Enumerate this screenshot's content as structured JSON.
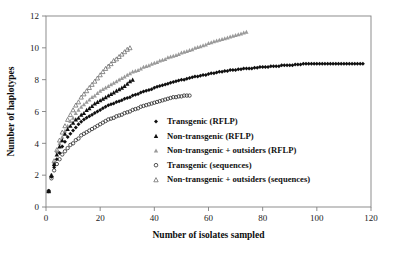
{
  "chart_data": {
    "type": "scatter",
    "title": "",
    "xlabel": "Number of isolates sampled",
    "ylabel": "Number of haplotypes",
    "xlim": [
      0,
      120
    ],
    "ylim": [
      0,
      12
    ],
    "xticks": [
      0,
      20,
      40,
      60,
      80,
      100,
      120
    ],
    "yticks": [
      0,
      2,
      4,
      6,
      8,
      10,
      12
    ],
    "grid": false,
    "legend_position": "center",
    "series": [
      {
        "name": "Transgenic (RFLP)",
        "marker": "filled-diamond",
        "color": "#101010",
        "x": [
          1,
          2,
          3,
          4,
          5,
          6,
          7,
          8,
          9,
          10,
          11,
          12,
          13,
          14,
          15,
          16,
          17,
          18,
          19,
          20,
          21,
          22,
          23,
          24,
          25,
          26,
          27,
          28,
          29,
          30,
          31,
          32,
          33,
          34,
          35,
          36,
          37,
          38,
          39,
          40,
          41,
          42,
          43,
          44,
          45,
          46,
          47,
          48,
          49,
          50,
          51,
          52,
          53,
          54,
          55,
          56,
          57,
          58,
          59,
          60,
          61,
          62,
          63,
          64,
          65,
          66,
          67,
          68,
          69,
          70,
          71,
          72,
          73,
          74,
          75,
          76,
          77,
          78,
          79,
          80,
          81,
          82,
          83,
          84,
          85,
          86,
          87,
          88,
          89,
          90,
          91,
          92,
          93,
          94,
          95,
          96,
          97,
          98,
          99,
          100,
          101,
          102,
          103,
          104,
          105,
          106,
          107,
          108,
          109,
          110,
          111,
          112,
          113,
          114,
          115,
          116,
          117
        ],
        "y": [
          1.0,
          1.9,
          2.5,
          3.0,
          3.4,
          3.8,
          4.1,
          4.4,
          4.6,
          4.8,
          5.0,
          5.2,
          5.35,
          5.5,
          5.6,
          5.7,
          5.8,
          5.9,
          6.0,
          6.1,
          6.2,
          6.3,
          6.4,
          6.45,
          6.5,
          6.6,
          6.65,
          6.7,
          6.8,
          6.85,
          6.9,
          7.0,
          7.05,
          7.1,
          7.2,
          7.25,
          7.3,
          7.35,
          7.4,
          7.5,
          7.55,
          7.6,
          7.65,
          7.7,
          7.75,
          7.8,
          7.85,
          7.9,
          7.95,
          8.0,
          8.0,
          8.05,
          8.1,
          8.15,
          8.2,
          8.2,
          8.25,
          8.3,
          8.3,
          8.35,
          8.4,
          8.4,
          8.45,
          8.5,
          8.5,
          8.55,
          8.55,
          8.6,
          8.6,
          8.6,
          8.65,
          8.65,
          8.7,
          8.7,
          8.7,
          8.7,
          8.75,
          8.75,
          8.8,
          8.8,
          8.8,
          8.8,
          8.85,
          8.85,
          8.85,
          8.85,
          8.9,
          8.9,
          8.9,
          8.9,
          8.9,
          8.95,
          8.95,
          8.95,
          9.0,
          9.0,
          9.0,
          9.0,
          9.0,
          9.0,
          9.0,
          9.0,
          9.0,
          9.0,
          9.0,
          9.0,
          9.0,
          9.0,
          9.0,
          9.0,
          9.0,
          9.0,
          9.0,
          9.0,
          9.0,
          9.0,
          9.0
        ]
      },
      {
        "name": "Non-transgenic (RFLP)",
        "marker": "filled-triangle",
        "color": "#101010",
        "x": [
          1,
          2,
          3,
          4,
          5,
          6,
          7,
          8,
          9,
          10,
          11,
          12,
          13,
          14,
          15,
          16,
          17,
          18,
          19,
          20,
          21,
          22,
          23,
          24,
          25,
          26,
          27,
          28,
          29,
          30,
          31,
          32
        ],
        "y": [
          1.0,
          2.0,
          2.7,
          3.3,
          3.8,
          4.2,
          4.6,
          4.9,
          5.1,
          5.3,
          5.5,
          5.6,
          5.8,
          5.9,
          6.1,
          6.2,
          6.35,
          6.5,
          6.6,
          6.7,
          6.8,
          6.9,
          7.0,
          7.1,
          7.2,
          7.3,
          7.4,
          7.5,
          7.6,
          7.75,
          7.9,
          8.0
        ]
      },
      {
        "name": "Non-transgenic + outsiders (RFLP)",
        "marker": "grey-triangle",
        "color": "#9a9a9a",
        "x": [
          1,
          2,
          3,
          4,
          5,
          6,
          7,
          8,
          9,
          10,
          11,
          12,
          13,
          14,
          15,
          16,
          17,
          18,
          19,
          20,
          21,
          22,
          23,
          24,
          25,
          26,
          27,
          28,
          29,
          30,
          31,
          32,
          33,
          34,
          35,
          36,
          37,
          38,
          39,
          40,
          41,
          42,
          43,
          44,
          45,
          46,
          47,
          48,
          49,
          50,
          51,
          52,
          53,
          54,
          55,
          56,
          57,
          58,
          59,
          60,
          61,
          62,
          63,
          64,
          65,
          66,
          67,
          68,
          69,
          70,
          71,
          72,
          73,
          74
        ],
        "y": [
          1.0,
          2.0,
          2.8,
          3.5,
          4.0,
          4.4,
          4.8,
          5.1,
          5.4,
          5.6,
          5.9,
          6.1,
          6.3,
          6.45,
          6.6,
          6.75,
          6.9,
          7.0,
          7.15,
          7.3,
          7.4,
          7.5,
          7.6,
          7.7,
          7.8,
          7.9,
          8.0,
          8.1,
          8.2,
          8.3,
          8.4,
          8.5,
          8.55,
          8.6,
          8.7,
          8.8,
          8.85,
          8.9,
          9.0,
          9.05,
          9.1,
          9.2,
          9.25,
          9.3,
          9.4,
          9.45,
          9.5,
          9.55,
          9.6,
          9.7,
          9.75,
          9.8,
          9.85,
          9.9,
          10.0,
          10.05,
          10.1,
          10.15,
          10.2,
          10.3,
          10.35,
          10.4,
          10.45,
          10.5,
          10.55,
          10.6,
          10.65,
          10.7,
          10.75,
          10.8,
          10.85,
          10.9,
          10.95,
          11.0
        ]
      },
      {
        "name": "Transgenic (sequences)",
        "marker": "open-circle",
        "color": "#2b2b2b",
        "x": [
          1,
          2,
          3,
          4,
          5,
          6,
          7,
          8,
          9,
          10,
          11,
          12,
          13,
          14,
          15,
          16,
          17,
          18,
          19,
          20,
          21,
          22,
          23,
          24,
          25,
          26,
          27,
          28,
          29,
          30,
          31,
          32,
          33,
          34,
          35,
          36,
          37,
          38,
          39,
          40,
          41,
          42,
          43,
          44,
          45,
          46,
          47,
          48,
          49,
          50,
          51,
          52,
          53
        ],
        "y": [
          1.0,
          1.8,
          2.3,
          2.7,
          3.0,
          3.3,
          3.5,
          3.7,
          3.9,
          4.0,
          4.2,
          4.3,
          4.5,
          4.6,
          4.7,
          4.8,
          4.9,
          5.0,
          5.1,
          5.2,
          5.3,
          5.4,
          5.5,
          5.55,
          5.6,
          5.7,
          5.75,
          5.8,
          5.9,
          5.95,
          6.0,
          6.1,
          6.15,
          6.2,
          6.3,
          6.35,
          6.4,
          6.45,
          6.5,
          6.55,
          6.6,
          6.65,
          6.7,
          6.75,
          6.8,
          6.85,
          6.9,
          6.9,
          6.95,
          6.95,
          7.0,
          7.0,
          7.0
        ]
      },
      {
        "name": "Non-transgenic + outsiders (sequences)",
        "marker": "open-triangle",
        "color": "#6e6e6e",
        "x": [
          1,
          2,
          3,
          4,
          5,
          6,
          7,
          8,
          9,
          10,
          11,
          12,
          13,
          14,
          15,
          16,
          17,
          18,
          19,
          20,
          21,
          22,
          23,
          24,
          25,
          26,
          27,
          28,
          29,
          30,
          31
        ],
        "y": [
          1.0,
          2.0,
          2.9,
          3.6,
          4.2,
          4.7,
          5.1,
          5.5,
          5.8,
          6.1,
          6.4,
          6.6,
          6.9,
          7.1,
          7.3,
          7.5,
          7.7,
          7.9,
          8.1,
          8.3,
          8.5,
          8.7,
          8.85,
          9.0,
          9.2,
          9.3,
          9.45,
          9.6,
          9.75,
          9.9,
          10.0
        ]
      }
    ]
  },
  "legend": {
    "items": [
      {
        "label": "Transgenic (RFLP)",
        "marker": "filled-diamond"
      },
      {
        "label": "Non-transgenic (RFLP)",
        "marker": "filled-triangle"
      },
      {
        "label": "Non-transgenic + outsiders (RFLP)",
        "marker": "grey-triangle"
      },
      {
        "label": "Transgenic (sequences)",
        "marker": "open-circle"
      },
      {
        "label": "Non-transgenic + outsiders (sequences)",
        "marker": "open-triangle"
      }
    ]
  },
  "colors": {
    "black": "#101010",
    "grey": "#9a9a9a",
    "open_grey": "#6e6e6e",
    "axis": "#808080",
    "background": "#ffffff"
  }
}
